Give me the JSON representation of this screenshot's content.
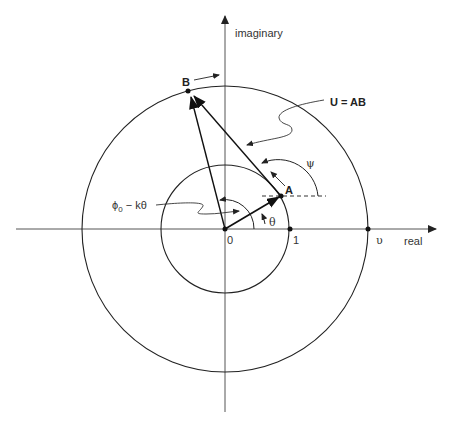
{
  "diagram": {
    "axes": {
      "real_label": "real",
      "imaginary_label": "imaginary"
    },
    "points": {
      "origin_label": "0",
      "unit_label": "1",
      "upsilon_label": "υ",
      "A_label": "A",
      "B_label": "B"
    },
    "annotations": {
      "U_label": "U = AB",
      "psi_label": "ψ",
      "theta_label": "θ",
      "phi_label_main": "ϕ",
      "phi_label_sub": "0",
      "phi_label_rest": " − kθ"
    },
    "colors": {
      "stroke": "#222222",
      "axis": "#555555",
      "text": "#333333"
    },
    "geometry": {
      "origin": [
        225,
        229
      ],
      "inner_radius": 64,
      "outer_radius": 143,
      "point_A": [
        281,
        196
      ],
      "point_B": [
        188,
        91
      ]
    }
  }
}
